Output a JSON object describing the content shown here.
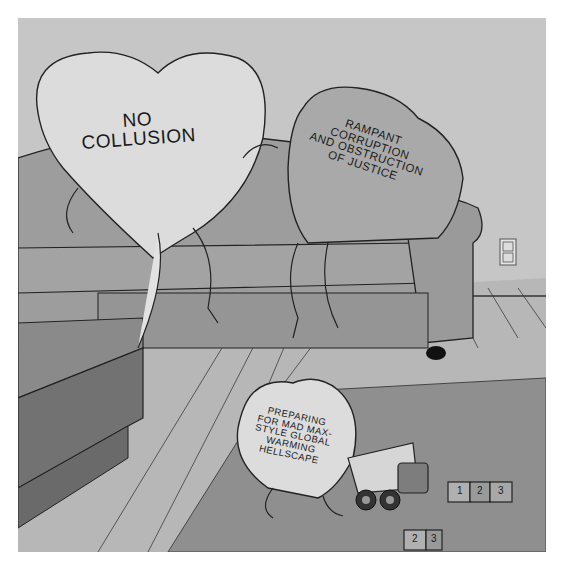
{
  "cartoon": {
    "hearts": [
      {
        "id": "left",
        "text": "NO\nCOLLUSION"
      },
      {
        "id": "middle",
        "text": "RAMPANT\nCORRUPTION\nAND OBSTRUCTION\nOF JUSTICE"
      },
      {
        "id": "small",
        "text": "PREPARING\nFOR MAD MAX-\nSTYLE GLOBAL\nWARMING\nHELLSCAPE"
      }
    ],
    "blocks": [
      "1",
      "2",
      "3",
      "2",
      "3"
    ],
    "colors": {
      "wall": "#c6c6c6",
      "floor": "#b4b4b4",
      "rug": "#8f8f8f",
      "couch": "#9d9d9d",
      "table": "#7b7b7b",
      "heart_light": "#dcdcdc",
      "heart_dark": "#a9a9a9"
    }
  }
}
